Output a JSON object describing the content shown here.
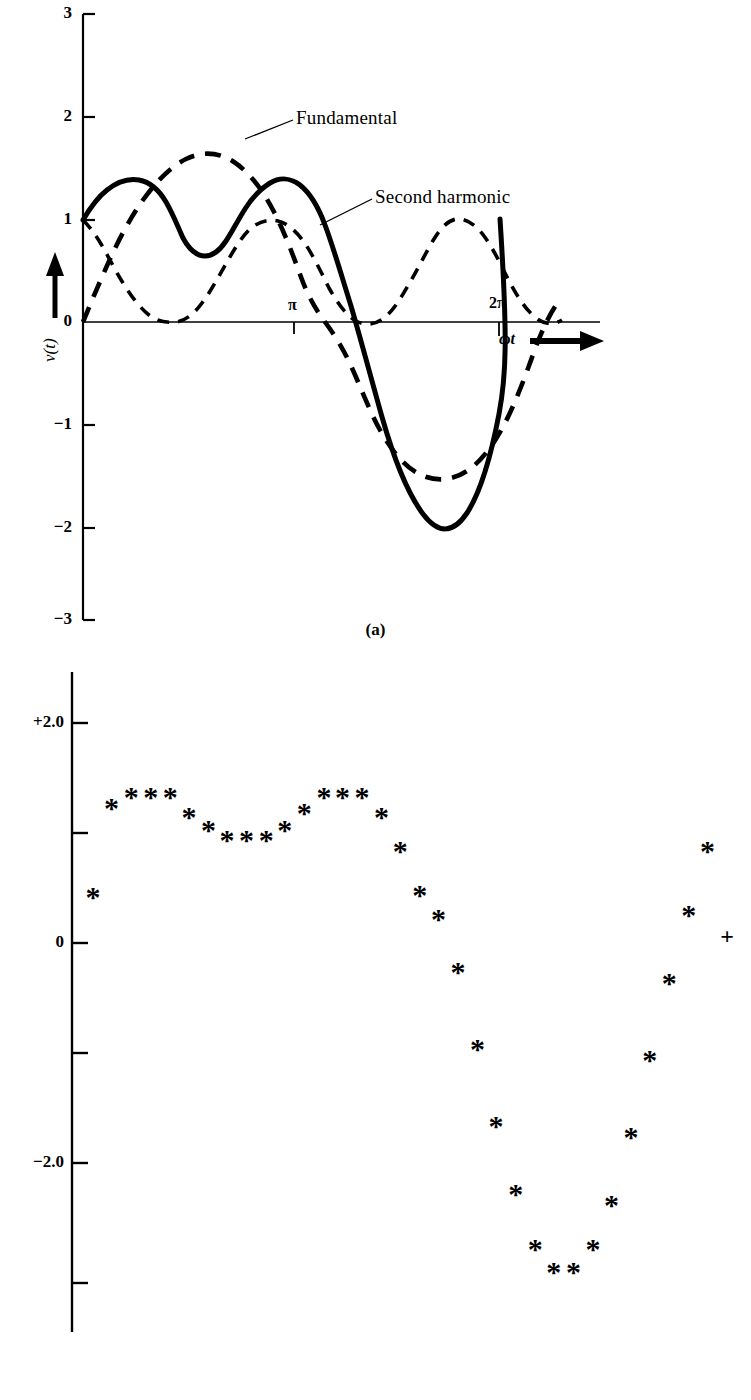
{
  "figure_a": {
    "caption": "(a)",
    "y_axis_label": "v(t)",
    "x_axis_label": "ωt",
    "y_ticks": [
      "3",
      "2",
      "1",
      "0",
      "−1",
      "−2",
      "−3"
    ],
    "x_ticks": [
      "π",
      "2π"
    ],
    "annotations": [
      {
        "label": "Fundamental"
      },
      {
        "label": "Second harmonic"
      }
    ]
  },
  "figure_b": {
    "caption": "(b)",
    "y_ticks_labeled": [
      "+2.0",
      "0",
      "−2.0"
    ],
    "marker_plus": "+"
  },
  "chart_data": [
    {
      "id": "figure_a",
      "type": "line",
      "title": "",
      "xlabel": "ωt",
      "ylabel": "v(t)",
      "xlim": [
        0,
        7.6
      ],
      "ylim": [
        -3,
        3
      ],
      "x_tick_values": [
        3.14159,
        6.28319
      ],
      "x_tick_labels": [
        "π",
        "2π"
      ],
      "y_tick_values": [
        3,
        2,
        1,
        0,
        -1,
        -2,
        -3
      ],
      "y_tick_labels": [
        "3",
        "2",
        "1",
        "0",
        "−1",
        "−2",
        "−3"
      ],
      "grid": false,
      "legend": "inline-annotation",
      "series": [
        {
          "name": "Fundamental",
          "style": "dashed",
          "expression": "2*sin(wt)",
          "amplitude": 2,
          "period": 6.28319,
          "phase": 0,
          "x": [
            0,
            0.39,
            0.79,
            1.18,
            1.57,
            1.96,
            2.36,
            2.75,
            3.14,
            3.53,
            3.93,
            4.32,
            4.71,
            5.11,
            5.5,
            5.89,
            6.28,
            6.68,
            7.07,
            7.46
          ],
          "y": [
            0.0,
            0.77,
            1.41,
            1.85,
            2.0,
            1.85,
            1.41,
            0.77,
            0.0,
            -0.77,
            -1.41,
            -1.85,
            -2.0,
            -1.85,
            -1.41,
            -0.77,
            0.0,
            0.77,
            1.41,
            1.85
          ]
        },
        {
          "name": "Second harmonic",
          "style": "dashed",
          "expression": "cos(2*wt)",
          "amplitude": 1,
          "period": 3.14159,
          "phase": 0,
          "x": [
            0,
            0.39,
            0.79,
            1.18,
            1.57,
            1.96,
            2.36,
            2.75,
            3.14,
            3.53,
            3.93,
            4.32,
            4.71,
            5.11,
            5.5,
            5.89,
            6.28,
            6.68,
            7.07,
            7.46
          ],
          "y": [
            1.0,
            0.71,
            0.0,
            -0.71,
            -1.0,
            -0.71,
            0.0,
            0.71,
            1.0,
            0.71,
            0.0,
            -0.71,
            -1.0,
            -0.71,
            0.0,
            0.71,
            1.0,
            0.71,
            0.0,
            -0.71
          ]
        },
        {
          "name": "Sum",
          "style": "solid",
          "expression": "2*sin(wt) + cos(2*wt)",
          "x": [
            0,
            0.39,
            0.79,
            1.18,
            1.57,
            1.96,
            2.36,
            2.75,
            3.14,
            3.53,
            3.93,
            4.32,
            4.71,
            5.11,
            5.5,
            5.89,
            6.28
          ],
          "y": [
            1.0,
            1.48,
            1.41,
            1.14,
            1.0,
            1.14,
            1.41,
            1.48,
            1.0,
            -0.06,
            -1.41,
            -2.56,
            -3.0,
            -2.56,
            -1.41,
            -0.06,
            1.0
          ]
        }
      ]
    },
    {
      "id": "figure_b",
      "type": "scatter",
      "title": "",
      "xlabel": "",
      "ylabel": "",
      "ylim": [
        -3.4,
        2.4
      ],
      "y_tick_values": [
        2.0,
        1.0,
        0.0,
        -1.0,
        -2.0,
        -3.0
      ],
      "y_tick_labels": [
        "+2.0",
        "",
        "0",
        "",
        "−2.0",
        ""
      ],
      "grid": false,
      "marker_symbol": "*",
      "last_marker_symbol": "+",
      "points": [
        {
          "x": 0.0,
          "y": 0.38,
          "marker": "*"
        },
        {
          "x": 0.19,
          "y": 1.19,
          "marker": "*"
        },
        {
          "x": 0.39,
          "y": 1.29,
          "marker": "*"
        },
        {
          "x": 0.59,
          "y": 1.29,
          "marker": "*"
        },
        {
          "x": 0.79,
          "y": 1.29,
          "marker": "*"
        },
        {
          "x": 0.98,
          "y": 1.11,
          "marker": "*"
        },
        {
          "x": 1.18,
          "y": 0.99,
          "marker": "*"
        },
        {
          "x": 1.37,
          "y": 0.9,
          "marker": "*"
        },
        {
          "x": 1.57,
          "y": 0.9,
          "marker": "*"
        },
        {
          "x": 1.77,
          "y": 0.9,
          "marker": "*"
        },
        {
          "x": 1.96,
          "y": 0.99,
          "marker": "*"
        },
        {
          "x": 2.16,
          "y": 1.15,
          "marker": "*"
        },
        {
          "x": 2.36,
          "y": 1.29,
          "marker": "*"
        },
        {
          "x": 2.55,
          "y": 1.29,
          "marker": "*"
        },
        {
          "x": 2.75,
          "y": 1.29,
          "marker": "*"
        },
        {
          "x": 2.95,
          "y": 1.11,
          "marker": "*"
        },
        {
          "x": 3.14,
          "y": 0.8,
          "marker": "*"
        },
        {
          "x": 3.34,
          "y": 0.4,
          "marker": "*"
        },
        {
          "x": 3.53,
          "y": 0.18,
          "marker": "*"
        },
        {
          "x": 3.73,
          "y": -0.3,
          "marker": "*"
        },
        {
          "x": 3.93,
          "y": -1.0,
          "marker": "*"
        },
        {
          "x": 4.12,
          "y": -1.7,
          "marker": "*"
        },
        {
          "x": 4.32,
          "y": -2.32,
          "marker": "*"
        },
        {
          "x": 4.52,
          "y": -2.82,
          "marker": "*"
        },
        {
          "x": 4.71,
          "y": -3.03,
          "marker": "*"
        },
        {
          "x": 4.91,
          "y": -3.03,
          "marker": "*"
        },
        {
          "x": 5.11,
          "y": -2.82,
          "marker": "*"
        },
        {
          "x": 5.3,
          "y": -2.42,
          "marker": "*"
        },
        {
          "x": 5.5,
          "y": -1.8,
          "marker": "*"
        },
        {
          "x": 5.69,
          "y": -1.1,
          "marker": "*"
        },
        {
          "x": 5.89,
          "y": -0.4,
          "marker": "*"
        },
        {
          "x": 6.09,
          "y": 0.22,
          "marker": "*"
        },
        {
          "x": 6.28,
          "y": 0.8,
          "marker": "*"
        },
        {
          "x": 6.48,
          "y": 0.05,
          "marker": "+"
        }
      ]
    }
  ]
}
